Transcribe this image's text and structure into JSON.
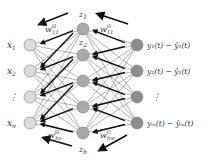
{
  "diagram": {
    "type": "neural-network",
    "colors": {
      "input_fill": "#dcdcdc",
      "hidden_fill": "#a8a8a8",
      "output_fill": "#8c8c8c",
      "node_stroke": "#7a7a7a",
      "edge": "#555555",
      "arrow": "#111111",
      "text": "#333333"
    },
    "input_nodes": [
      {
        "label": "x",
        "sub": "1"
      },
      {
        "label": "x",
        "sub": "2"
      },
      {
        "label": "⋮",
        "sub": ""
      },
      {
        "label": "x",
        "sub": "n"
      }
    ],
    "hidden_nodes": [
      {
        "label": "z",
        "sub": "1"
      },
      {
        "label": "z",
        "sub": "2"
      },
      {
        "label": "",
        "sub": ""
      },
      {
        "label": "",
        "sub": ""
      },
      {
        "label": "z",
        "sub": "h"
      }
    ],
    "output_nodes": [
      {
        "label": "y₁(t) − ŷ₁(t)"
      },
      {
        "label": "y₂(t) − ŷ₂(t)"
      },
      {
        "label": "⋮"
      },
      {
        "label": "yₘ(t) − ŷₘ(t)"
      }
    ],
    "weight_labels": {
      "top_hidden": {
        "base": "w",
        "sup": "H",
        "sub": "11"
      },
      "top_output": {
        "base": "w",
        "sup": "O",
        "sub": "11"
      },
      "bottom_hidden": {
        "base": "w",
        "sup": "H",
        "sub": "hn"
      },
      "bottom_output": {
        "base": "w",
        "sup": "O",
        "sub": "hm"
      }
    }
  }
}
